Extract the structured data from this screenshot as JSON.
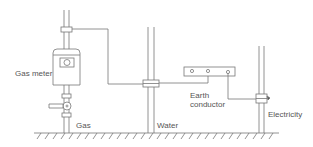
{
  "diagram": {
    "type": "equipotential bonding",
    "labels": {
      "gas_meter": "Gas meter",
      "gas": "Gas",
      "water": "Water",
      "earth_conductor_line1": "Earth",
      "earth_conductor_line2": "conductor",
      "electricity": "Electricity"
    },
    "colors": {
      "line": "#777777",
      "background": "#ffffff"
    }
  }
}
